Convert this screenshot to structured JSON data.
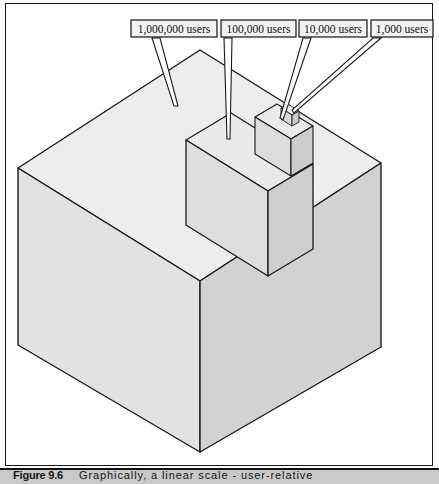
{
  "figure": {
    "caption_label": "Figure 9.6",
    "caption_text": "Graphically, a linear scale - user-relative",
    "background_color": "#ffffff",
    "frame_color": "#1a1a1a",
    "caption_band_color": "#c9c9c9"
  },
  "callouts": [
    {
      "id": "callout-1000000",
      "label": "1,000,000 users",
      "box": {
        "x": 131,
        "y": 20,
        "width": 86,
        "height": 17
      }
    },
    {
      "id": "callout-100000",
      "label": "100,000 users",
      "box": {
        "x": 221,
        "y": 20,
        "width": 75,
        "height": 17
      }
    },
    {
      "id": "callout-10000",
      "label": "10,000 users",
      "box": {
        "x": 299,
        "y": 20,
        "width": 68,
        "height": 17
      }
    },
    {
      "id": "callout-1000",
      "label": "1,000 users",
      "box": {
        "x": 371,
        "y": 20,
        "width": 62,
        "height": 17
      }
    }
  ],
  "cubes": [
    {
      "id": "cube-1000000",
      "users": 1000000,
      "label": "1,000,000 users",
      "top_face_color": "#ececec",
      "left_face_color": "#dedede",
      "right_face_color": "#d0d0d0",
      "edge_color": "#1a1a1a",
      "top_vertex": {
        "x": 200,
        "y": 50
      },
      "left_vertex": {
        "x": 18,
        "y": 345
      },
      "right_vertex": {
        "x": 381,
        "y": 347
      },
      "bottom_vertex": {
        "x": 200,
        "y": 452
      }
    },
    {
      "id": "cube-100000",
      "users": 100000,
      "label": "100,000 users",
      "top_face_color": "#e9e9e9",
      "left_face_color": "#dcdcdc",
      "right_face_color": "#cfcfcf",
      "edge_color": "#1a1a1a",
      "top_vertex": {
        "x": 231,
        "y": 113
      },
      "left_vertex": {
        "x": 200,
        "y": 124
      },
      "right_vertex": {
        "x": 313,
        "y": 137
      },
      "bottom_vertex": {
        "x": 268,
        "y": 155
      }
    },
    {
      "id": "cube-10000",
      "users": 10000,
      "label": "10,000 users",
      "top_face_color": "#eaeaea",
      "left_face_color": "#dadada",
      "right_face_color": "#cdcdcd",
      "edge_color": "#1a1a1a",
      "top_vertex": {
        "x": 277,
        "y": 103
      },
      "left_vertex": {
        "x": 263,
        "y": 108
      },
      "right_vertex": {
        "x": 310,
        "y": 114
      },
      "bottom_vertex": {
        "x": 291,
        "y": 121
      }
    },
    {
      "id": "cube-1000",
      "users": 1000,
      "label": "1,000 users",
      "top_face_color": "#ededed",
      "left_face_color": "#d8d8d8",
      "right_face_color": "#cacaca",
      "edge_color": "#1a1a1a",
      "top_vertex": {
        "x": 288,
        "y": 108
      },
      "left_vertex": {
        "x": 283,
        "y": 110
      },
      "right_vertex": {
        "x": 296,
        "y": 112
      },
      "bottom_vertex": {
        "x": 290,
        "y": 115
      }
    }
  ],
  "leader_lines": [
    {
      "id": "leader-1000000",
      "from": {
        "x": 158,
        "y": 37
      },
      "to": {
        "x": 172,
        "y": 65
      }
    },
    {
      "id": "leader-100000",
      "from": {
        "x": 228,
        "y": 37
      },
      "to": {
        "x": 228,
        "y": 119
      }
    },
    {
      "id": "leader-10000",
      "from": {
        "x": 310,
        "y": 37
      },
      "to": {
        "x": 282,
        "y": 112
      }
    },
    {
      "id": "leader-1000",
      "from": {
        "x": 379,
        "y": 37
      },
      "to": {
        "x": 292,
        "y": 110
      }
    }
  ]
}
